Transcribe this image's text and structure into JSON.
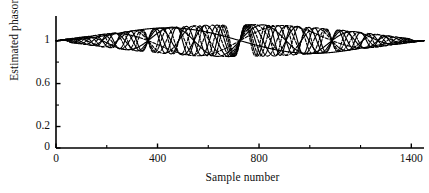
{
  "chart_data": {
    "type": "line",
    "title": "",
    "xlabel": "Sample number",
    "ylabel": "Estimated phasor magnitude",
    "xlim": [
      0,
      1450
    ],
    "ylim": [
      0,
      1.22
    ],
    "grid": false,
    "legend": null,
    "xticks": [
      {
        "value": 0,
        "label": "0"
      },
      {
        "value": 400,
        "label": "400"
      },
      {
        "value": 800,
        "label": "800"
      },
      {
        "value": 1400,
        "label": "1400"
      }
    ],
    "xticks_minor": [
      200,
      600,
      1000,
      1200
    ],
    "yticks": [
      {
        "value": 0,
        "label": "0"
      },
      {
        "value": 0.2,
        "label": "0.2"
      },
      {
        "value": 0.6,
        "label": "0.6"
      },
      {
        "value": 1.0,
        "label": "1"
      }
    ],
    "yticks_minor": [
      0.4,
      0.8
    ],
    "series": [
      {
        "name": "trace-1",
        "style": "solid",
        "mean": 1.0,
        "amplitude": 0.155,
        "cycles": 1.0,
        "phase_deg": 0
      },
      {
        "name": "trace-2",
        "style": "dashed",
        "mean": 1.0,
        "amplitude": 0.152,
        "cycles": 2.0,
        "phase_deg": 0
      },
      {
        "name": "trace-3",
        "style": "solid",
        "mean": 1.0,
        "amplitude": 0.15,
        "cycles": 4.0,
        "phase_deg": 0
      },
      {
        "name": "trace-4",
        "style": "dashed",
        "mean": 1.0,
        "amplitude": 0.15,
        "cycles": 6.0,
        "phase_deg": 0
      },
      {
        "name": "trace-5",
        "style": "solid",
        "mean": 1.0,
        "amplitude": 0.15,
        "cycles": 8.0,
        "phase_deg": 0
      },
      {
        "name": "trace-6",
        "style": "dashed",
        "mean": 1.0,
        "amplitude": 0.148,
        "cycles": 10.0,
        "phase_deg": 0
      },
      {
        "name": "trace-7",
        "style": "solid",
        "mean": 1.0,
        "amplitude": 0.148,
        "cycles": 12.0,
        "phase_deg": 0
      },
      {
        "name": "trace-8",
        "style": "dashed",
        "mean": 1.0,
        "amplitude": 0.146,
        "cycles": 14.0,
        "phase_deg": 0
      },
      {
        "name": "trace-9",
        "style": "solid",
        "mean": 1.0,
        "amplitude": 0.146,
        "cycles": 16.0,
        "phase_deg": 0
      },
      {
        "name": "trace-10",
        "style": "dashed",
        "mean": 1.0,
        "amplitude": 0.145,
        "cycles": 18.0,
        "phase_deg": 0
      }
    ]
  },
  "axis": {
    "line_color": "#000000"
  }
}
